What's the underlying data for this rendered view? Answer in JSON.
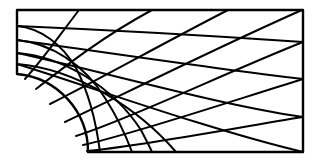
{
  "figure": {
    "name": "quarter-plate-with-hole-mesh",
    "kind": "mesh-diagram",
    "background_color": "#ffffff",
    "line_color": "#000000",
    "boundary_stroke_width": 2.4,
    "interior_stroke_width": 2.0,
    "canvas": {
      "width": 320,
      "height": 165
    }
  },
  "geometry": {
    "plate": {
      "left_x": 17,
      "right_x": 303,
      "top_y": 10,
      "bottom_y": 152
    },
    "hole": {
      "center_x": 17,
      "center_y": 152,
      "radius": 78,
      "arc_start": {
        "x": 17,
        "y": 74
      },
      "arc_end": {
        "x": 88,
        "y": 152
      },
      "description": "quarter circular hole at lower-left corner"
    },
    "radial_divisions": 8,
    "circumferential_divisions": 5
  },
  "boundary": {
    "outline_path": "M 17 10 L 303 10 L 303 152 L 88 152 A 78 78 0 0 0 17 74 Z",
    "segments": [
      {
        "name": "top-edge",
        "from": [
          17,
          10
        ],
        "to": [
          303,
          10
        ]
      },
      {
        "name": "right-edge",
        "from": [
          303,
          10
        ],
        "to": [
          303,
          152
        ]
      },
      {
        "name": "bottom-edge",
        "from": [
          303,
          152
        ],
        "to": [
          88,
          152
        ]
      },
      {
        "name": "hole-arc",
        "from": [
          88,
          152
        ],
        "to": [
          17,
          74
        ]
      },
      {
        "name": "left-edge",
        "from": [
          17,
          74
        ],
        "to": [
          17,
          10
        ]
      }
    ]
  },
  "mesh": {
    "radial_lines": [
      {
        "id": "radial-0",
        "path": "M 17 74 L 17 10"
      },
      {
        "id": "radial-1",
        "path": "M 25 79 C 44 58 56 40 79 10"
      },
      {
        "id": "radial-2",
        "path": "M 36 89 C 68 64 104 36 152 10"
      },
      {
        "id": "radial-3",
        "path": "M 50 104 C 96 81 160 45 228 10"
      },
      {
        "id": "radial-4",
        "path": "M 65 122 C 124 94 216 48 302 10"
      },
      {
        "id": "radial-5",
        "path": "M 76 136 C 130 119 227 72 303 42"
      },
      {
        "id": "radial-6",
        "path": "M 83 145 C 134 134 235 100 303 79"
      },
      {
        "id": "radial-7",
        "path": "M 87 151 C 140 146 240 127 303 117"
      }
    ],
    "circumferential_lines": [
      {
        "id": "ring-1",
        "path": "M 17 26 C 40 28 62 44 76 68 C 89 93 96 121 100 152"
      },
      {
        "id": "ring-2",
        "path": "M 17 40 C 50 43 84 64 105 98 C 118 118 126 136 132 152"
      },
      {
        "id": "ring-3",
        "path": "M 17 53 C 64 57 112 86 141 130 C 145 138 149 145 152 152"
      },
      {
        "id": "ring-4",
        "path": "M 17 64 C 78 69 140 110 176 152"
      }
    ],
    "outer_bands": [
      {
        "id": "band-1",
        "path": "M 17 26 C 110 30 215 36 303 42"
      },
      {
        "id": "band-2",
        "path": "M 17 40 C 110 53 216 69 303 79"
      },
      {
        "id": "band-3",
        "path": "M 17 53 C 105 72 215 104 303 117"
      },
      {
        "id": "band-4",
        "path": "M 17 64 C 88 86 210 130 303 152"
      }
    ],
    "hole_ring_lines": [
      {
        "id": "hole-ring-a",
        "path": "M 17 74 C 45 76 70 94 86 120 C 94 132 99 143 102 152"
      }
    ],
    "bottom_radials": [
      {
        "id": "bottom-radial-1",
        "x_at_bottom": 123
      },
      {
        "id": "bottom-radial-2",
        "x_at_bottom": 172
      },
      {
        "id": "bottom-radial-3",
        "x_at_bottom": 215
      },
      {
        "id": "bottom-radial-4",
        "x_at_bottom": 260
      }
    ],
    "right_edge_nodes": [
      {
        "id": "right-node-1",
        "y": 10
      },
      {
        "id": "right-node-2",
        "y": 42
      },
      {
        "id": "right-node-3",
        "y": 79
      },
      {
        "id": "right-node-4",
        "y": 117
      },
      {
        "id": "right-node-5",
        "y": 152
      }
    ],
    "left_edge_nodes": [
      {
        "id": "left-node-1",
        "y": 10
      },
      {
        "id": "left-node-2",
        "y": 26
      },
      {
        "id": "left-node-3",
        "y": 40
      },
      {
        "id": "left-node-4",
        "y": 53
      },
      {
        "id": "left-node-5",
        "y": 64
      },
      {
        "id": "left-node-6",
        "y": 74
      }
    ],
    "top_edge_nodes": [
      {
        "id": "top-node-1",
        "x": 17
      },
      {
        "id": "top-node-2",
        "x": 79
      },
      {
        "id": "top-node-3",
        "x": 152
      },
      {
        "id": "top-node-4",
        "x": 228
      },
      {
        "id": "top-node-5",
        "x": 302
      }
    ]
  }
}
